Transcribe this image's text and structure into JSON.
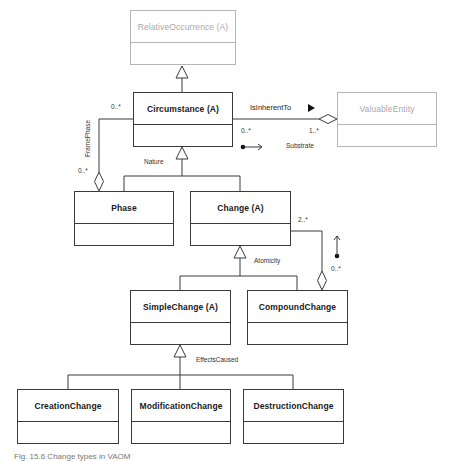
{
  "diagram": {
    "type": "uml-class-diagram",
    "classes": {
      "relative_occurrence": {
        "name": "RelativeOccurrence (A)",
        "faded": true
      },
      "circumstance": {
        "name": "Circumstance (A)"
      },
      "valuable_entity": {
        "name": "ValuableEntity",
        "faded": true
      },
      "phase": {
        "name": "Phase"
      },
      "change": {
        "name": "Change (A)"
      },
      "simple_change": {
        "name": "SimpleChange (A)"
      },
      "compound_change": {
        "name": "CompoundChange"
      },
      "creation_change": {
        "name": "CreationChange"
      },
      "modification_change": {
        "name": "ModificationChange"
      },
      "destruction_change": {
        "name": "DestructionChange"
      }
    },
    "associations": {
      "is_inherent_to": {
        "label": "IsInherentTo",
        "direction_icon": "filled-triangle-right",
        "source_multiplicity": "0..*",
        "target_multiplicity": "1..*",
        "role": "Substrate"
      },
      "frame_phase": {
        "label": "FramePhase",
        "circumstance_multiplicity": "0..*",
        "phase_multiplicity": "0..*"
      },
      "compound_composition": {
        "change_multiplicity": "2..*",
        "compound_multiplicity": "0..*"
      }
    },
    "generalization_sets": {
      "nature": "Nature",
      "atomicity": "Atomicity",
      "effects_caused": "EffectsCaused"
    }
  },
  "caption": "Fig. 15.6  Change types in VAOM"
}
